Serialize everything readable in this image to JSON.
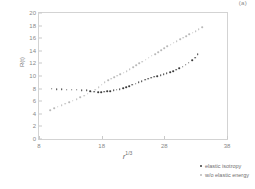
{
  "figure": {
    "corner_tag": "(a)"
  },
  "chart_data": {
    "type": "scatter",
    "title": "",
    "xlabel": "r 1/3",
    "xlabel_base": "r",
    "xlabel_sup": "1/3",
    "ylabel": "R(t)",
    "xlim": [
      8,
      38
    ],
    "ylim": [
      0,
      20
    ],
    "xticks": [
      8,
      18,
      28,
      38
    ],
    "yticks": [
      0,
      2,
      4,
      6,
      8,
      10,
      12,
      14,
      16,
      18,
      20
    ],
    "grid": false,
    "legend_position": "lower-right-inside",
    "colors": {
      "series_a": "#3b3b3b",
      "series_b": "#b9b9b9"
    },
    "series": [
      {
        "name": "elastic isotropy",
        "color": "#3b3b3b",
        "x": [
          10.0,
          10.8,
          11.6,
          12.4,
          13.2,
          14.0,
          14.8,
          15.6,
          16.2,
          16.8,
          17.4,
          17.9,
          18.4,
          18.9,
          19.4,
          19.9,
          20.4,
          20.9,
          21.4,
          21.9,
          22.4,
          22.9,
          23.4,
          23.9,
          24.4,
          24.9,
          25.4,
          25.9,
          26.4,
          26.9,
          27.4,
          27.9,
          28.4,
          28.9,
          29.4,
          29.9,
          30.4,
          30.9,
          31.4,
          31.9,
          32.4,
          32.9,
          33.3
        ],
        "y": [
          8.0,
          7.95,
          7.9,
          7.85,
          7.82,
          7.8,
          7.78,
          7.72,
          7.6,
          7.5,
          7.45,
          7.45,
          7.5,
          7.55,
          7.6,
          7.7,
          7.8,
          7.9,
          8.05,
          8.2,
          8.4,
          8.6,
          8.8,
          9.0,
          9.2,
          9.4,
          9.6,
          9.75,
          9.9,
          10.0,
          10.15,
          10.3,
          10.45,
          10.6,
          10.8,
          11.0,
          11.25,
          11.5,
          11.8,
          12.1,
          12.5,
          12.9,
          13.5
        ]
      },
      {
        "name": "w/o elastic energy",
        "color": "#b9b9b9",
        "x": [
          9.8,
          10.4,
          11.0,
          11.6,
          12.2,
          12.8,
          13.4,
          14.0,
          14.6,
          15.2,
          15.8,
          16.4,
          17.0,
          17.5,
          18.0,
          18.5,
          19.0,
          19.5,
          20.0,
          20.5,
          21.0,
          21.5,
          22.0,
          22.5,
          23.0,
          23.5,
          24.0,
          24.5,
          25.0,
          25.5,
          26.0,
          26.5,
          27.0,
          27.5,
          28.0,
          28.5,
          29.0,
          29.5,
          30.0,
          30.5,
          31.0,
          31.5,
          32.0,
          32.5,
          33.0,
          33.5,
          34.0
        ],
        "y": [
          4.6,
          4.9,
          5.1,
          5.35,
          5.6,
          5.85,
          6.1,
          6.35,
          6.6,
          6.9,
          7.2,
          7.5,
          7.85,
          8.2,
          8.6,
          9.0,
          9.35,
          9.6,
          9.85,
          10.05,
          10.3,
          10.55,
          10.8,
          11.1,
          11.4,
          11.7,
          12.0,
          12.3,
          12.6,
          12.9,
          13.2,
          13.5,
          13.8,
          14.1,
          14.4,
          14.7,
          15.0,
          15.3,
          15.55,
          15.8,
          16.1,
          16.35,
          16.6,
          16.85,
          17.1,
          17.4,
          17.7
        ]
      }
    ]
  }
}
